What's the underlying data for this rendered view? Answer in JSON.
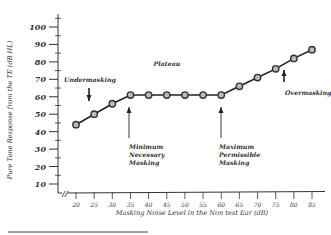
{
  "chart_data": {
    "type": "line",
    "title": "",
    "xlabel": "Masking Noise Level in the Non test Ear (dB)",
    "ylabel": "Pure Tone Response from the TE (dB HL)",
    "x": [
      20,
      25,
      30,
      35,
      40,
      45,
      50,
      55,
      60,
      65,
      70,
      75,
      80,
      85
    ],
    "y": [
      44,
      50,
      56,
      61,
      61,
      61,
      61,
      61,
      61,
      66,
      71,
      76,
      82,
      87
    ],
    "x_tick_labels": [
      "20",
      "25",
      "30",
      "35",
      "40",
      "45",
      "50",
      "55",
      "60",
      "65",
      "70",
      "75",
      "80",
      "85"
    ],
    "y_tick_labels": [
      "10",
      "20",
      "30",
      "40",
      "50",
      "60",
      "70",
      "80",
      "90",
      "100"
    ],
    "xlim": [
      20,
      85
    ],
    "ylim": [
      10,
      100
    ],
    "grid": false,
    "annotations": [
      {
        "text": "Undermasking",
        "arrow": "down",
        "x": 23
      },
      {
        "text": "Plateau",
        "arrow": "none",
        "x": 48
      },
      {
        "text": "Overmasking",
        "arrow": "up",
        "x": 78
      },
      {
        "text": "Minimum Necessary Masking",
        "lines": [
          "Minimum",
          "Necessary",
          "Masking"
        ],
        "arrow": "up",
        "x": 35
      },
      {
        "text": "Maximum Permissible Masking",
        "lines": [
          "Maximum",
          "Permissible",
          "Masking"
        ],
        "arrow": "up",
        "x": 60
      }
    ],
    "axis_break": "//"
  }
}
